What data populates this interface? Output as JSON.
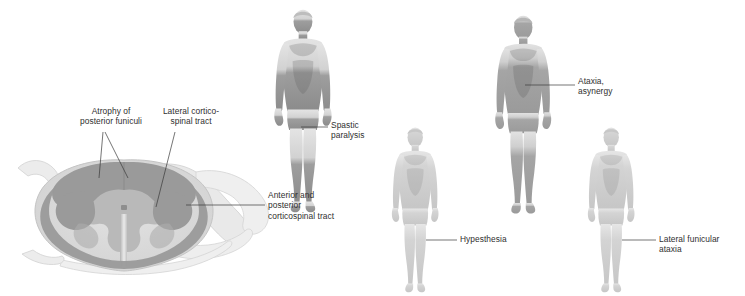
{
  "figure": {
    "background_color": "#ffffff",
    "text_color": "#2f2f2f"
  },
  "palette": {
    "white_matter_light": "#dcdcdc",
    "gray_matter": "#b9b9b9",
    "degenerated_tract": "#9a9a9a",
    "cord_outline": "#c9c9c9",
    "nerve_root": "#e4e4e4",
    "skin_light": "#d9d9d9",
    "skin_mid": "#bdbdbd",
    "skin_dark": "#8f8f8f",
    "leader_line": "#3a3a3a"
  },
  "cord_labels": [
    {
      "id": "atrophy-posterior-funiculi",
      "text": "Atrophy of\nposterior funiculi",
      "x": 68,
      "y": 106,
      "width": 86,
      "align": "center"
    },
    {
      "id": "lateral-corticospinal-tract",
      "text": "Lateral cortico-\nspinal tract",
      "x": 152,
      "y": 106,
      "width": 78,
      "align": "center"
    },
    {
      "id": "anterior-posterior-corticospinal-tract",
      "text": "Anterior and\nposterior\ncorticospinal tract",
      "x": 268,
      "y": 190,
      "width": 100,
      "align": "left"
    }
  ],
  "body_figures": [
    {
      "id": "spastic-paralysis",
      "label": "Spastic\nparalysis",
      "label_x": 331,
      "label_y": 120,
      "label_width": 60,
      "shading": "dark-lower-limbs",
      "description": "Male figure with darkened legs"
    },
    {
      "id": "ataxia-asynergy",
      "label": "Ataxia,\nasynergy",
      "label_x": 578,
      "label_y": 76,
      "label_width": 62,
      "shading": "dark-trunk-and-limbs",
      "description": "Male figure darkened from chest downward"
    },
    {
      "id": "hypesthesia",
      "label": "Hypesthesia",
      "label_x": 460,
      "label_y": 234,
      "label_width": 70,
      "shading": "light-uniform",
      "description": "Male figure in uniform light shading"
    },
    {
      "id": "lateral-funicular-ataxia",
      "label": "Lateral funicular\nataxia",
      "label_x": 659,
      "label_y": 234,
      "label_width": 86,
      "shading": "light-uniform",
      "description": "Male figure in uniform light shading"
    }
  ]
}
